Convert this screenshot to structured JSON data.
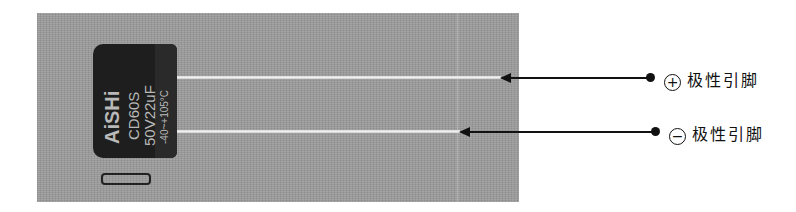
{
  "capacitor": {
    "brand": "AiSHi",
    "series": "CD60S",
    "rating": "50V22uF",
    "temp": "-40~+105°C"
  },
  "annotations": [
    {
      "symbol": "⊕",
      "symbol_char": "+",
      "label": "极性引脚",
      "polarity": "positive"
    },
    {
      "symbol": "⊖",
      "symbol_char": "−",
      "label": "极性引脚",
      "polarity": "negative"
    }
  ],
  "colors": {
    "photo_bg": "#9a9a9a",
    "capacitor": "#1e1e1e",
    "line": "#111111"
  }
}
